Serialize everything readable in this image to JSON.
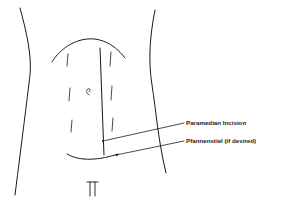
{
  "diagram": {
    "labels": [
      {
        "id": "paramedian",
        "text": "Paramedian Incision"
      },
      {
        "id": "pfannenstiel",
        "text": "Pfannenstiel (if desired)"
      }
    ],
    "colors": {
      "line": "#1a1a1a",
      "background": "#ffffff"
    }
  }
}
